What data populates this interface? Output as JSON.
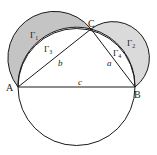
{
  "diagram": {
    "points": {
      "A": {
        "label": "A",
        "x": 18,
        "y": 87
      },
      "B": {
        "label": "B",
        "x": 135,
        "y": 87
      },
      "C": {
        "label": "C",
        "x": 91,
        "y": 29
      }
    },
    "sides": {
      "a": {
        "label": "a",
        "from": "B",
        "to": "C"
      },
      "b": {
        "label": "b",
        "from": "A",
        "to": "C"
      },
      "c": {
        "label": "c",
        "from": "A",
        "to": "B"
      }
    },
    "regions": {
      "gamma1": {
        "label": "Γ",
        "sub": "1",
        "desc": "outer lune on AC (shaded)"
      },
      "gamma2": {
        "label": "Γ",
        "sub": "2",
        "desc": "outer lune on BC (shaded)"
      },
      "gamma3": {
        "label": "Γ",
        "sub": "3",
        "desc": "circular segment on AC"
      },
      "gamma4": {
        "label": "Γ",
        "sub": "4",
        "desc": "circular segment on BC"
      }
    },
    "colors": {
      "stroke": "#1a1a1a",
      "lune1_fill": "#c4c4c4",
      "lune2_fill": "#dadada",
      "background": "#ffffff"
    }
  }
}
